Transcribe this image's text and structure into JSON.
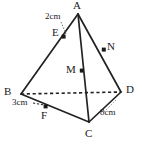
{
  "figure": {
    "kind": "tetrahedron-diagram",
    "stroke_color": "#222222",
    "background_color": "#ffffff",
    "vertices": [
      {
        "name": "A",
        "label": "A",
        "x": 78,
        "y": 14,
        "label_x": 74,
        "label_y": 0,
        "marked": false
      },
      {
        "name": "B",
        "label": "B",
        "x": 21,
        "y": 94,
        "label_x": 5,
        "label_y": 88,
        "marked": false
      },
      {
        "name": "C",
        "label": "C",
        "x": 89,
        "y": 122,
        "label_x": 85,
        "label_y": 128,
        "marked": false
      },
      {
        "name": "D",
        "label": "D",
        "x": 121,
        "y": 92,
        "label_x": 126,
        "label_y": 86,
        "marked": false
      }
    ],
    "points": [
      {
        "name": "E",
        "label": "E",
        "x": 64,
        "y": 37,
        "label_x": 53,
        "label_y": 28,
        "on_edge": "A-B",
        "marked": true
      },
      {
        "name": "N",
        "label": "N",
        "x": 104,
        "y": 50,
        "label_x": 108,
        "label_y": 42,
        "on_edge": "A-D",
        "marked": true
      },
      {
        "name": "M",
        "label": "M",
        "x": 82,
        "y": 71,
        "label_x": 68,
        "label_y": 65,
        "on_edge": "A-C",
        "marked": true
      },
      {
        "name": "F",
        "label": "F",
        "x": 46,
        "y": 107,
        "label_x": 41,
        "label_y": 112,
        "on_edge": "B-C",
        "marked": true
      }
    ],
    "edges": [
      {
        "name": "A-B",
        "from": "A",
        "to": "B",
        "style": "solid"
      },
      {
        "name": "A-C",
        "from": "A",
        "to": "C",
        "style": "solid"
      },
      {
        "name": "A-D",
        "from": "A",
        "to": "D",
        "style": "solid"
      },
      {
        "name": "B-C",
        "from": "B",
        "to": "C",
        "style": "solid"
      },
      {
        "name": "C-D",
        "from": "C",
        "to": "D",
        "style": "solid"
      },
      {
        "name": "B-D",
        "from": "B",
        "to": "D",
        "style": "dashed"
      }
    ],
    "measurements": [
      {
        "name": "AE",
        "label": "2cm",
        "label_x": 47,
        "label_y": 17,
        "leader": "dotted",
        "target_point": "E"
      },
      {
        "name": "BF",
        "label": "3cm",
        "label_x": 15,
        "label_y": 100,
        "leader": "dashed",
        "target_point": "F"
      },
      {
        "name": "CD",
        "label": "8cm",
        "label_x": 103,
        "label_y": 110,
        "leader": "dotted",
        "target_edge": "C-D"
      }
    ]
  }
}
